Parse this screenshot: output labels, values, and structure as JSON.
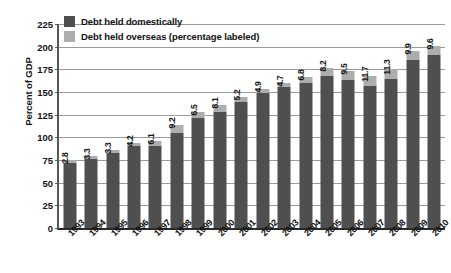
{
  "chart_data": {
    "type": "bar",
    "title": "",
    "xlabel": "",
    "ylabel": "Percent of GDP",
    "ylim": [
      0,
      225
    ],
    "yticks": [
      0,
      25,
      50,
      75,
      100,
      125,
      150,
      175,
      200,
      225
    ],
    "grid": true,
    "stacked": true,
    "legend_position": "top-left",
    "categories": [
      "1993",
      "1994",
      "1995",
      "1996",
      "1997",
      "1998",
      "1999",
      "2000",
      "2001",
      "2002",
      "2003",
      "2004",
      "2005",
      "2006",
      "2007",
      "2008",
      "2009",
      "2010"
    ],
    "series": [
      {
        "name": "Debt held domestically",
        "color": "#4f4f4f",
        "values": [
          72.0,
          76.0,
          83.2,
          90.0,
          90.4,
          104.5,
          121.0,
          127.8,
          139.5,
          148.5,
          155.5,
          160.0,
          168.0,
          163.5,
          156.5,
          164.5,
          185.8,
          190.8
        ]
      },
      {
        "name": "Debt held overseas (percentage labeled)",
        "color": "#adadad",
        "values": [
          2.8,
          3.3,
          3.3,
          4.2,
          6.1,
          9.2,
          6.5,
          8.1,
          5.2,
          4.9,
          4.7,
          6.8,
          8.2,
          9.5,
          11.7,
          11.3,
          9.9,
          9.6
        ]
      }
    ],
    "totals": [
      74.8,
      79.3,
      86.5,
      94.2,
      96.5,
      113.7,
      127.5,
      135.9,
      144.7,
      153.4,
      160.2,
      166.8,
      176.2,
      173.0,
      168.2,
      175.8,
      195.7,
      200.4
    ],
    "bar_labels": [
      "2.8",
      "3.3",
      "3.3",
      "4.2",
      "6.1",
      "9.2",
      "6.5",
      "8.1",
      "5.2",
      "4.9",
      "4.7",
      "6.8",
      "8.2",
      "9.5",
      "11.7",
      "11.3",
      "9.9",
      "9.6"
    ]
  },
  "legend": {
    "items": [
      {
        "label": "Debt held domestically",
        "color": "#4f4f4f"
      },
      {
        "label": "Debt held overseas (percentage labeled)",
        "color": "#adadad"
      }
    ]
  },
  "axis": {
    "y_title": "Percent of GDP",
    "y_ticks": [
      "225",
      "200",
      "175",
      "150",
      "125",
      "100",
      "75",
      "50",
      "25",
      "0"
    ]
  }
}
